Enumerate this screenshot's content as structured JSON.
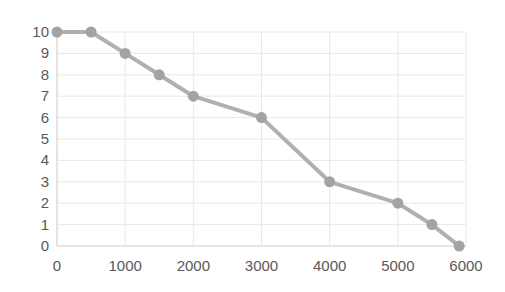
{
  "chart_data": {
    "type": "line",
    "title": "",
    "subtitle": "",
    "xlabel": "",
    "ylabel": "",
    "xlim": [
      0,
      6000
    ],
    "ylim": [
      0,
      10
    ],
    "xticks": [
      0,
      1000,
      2000,
      3000,
      4000,
      5000,
      6000
    ],
    "xtick_labels": [
      "0",
      "1000",
      "2000",
      "3000",
      "4000",
      "5000",
      "6000"
    ],
    "yticks": [
      0,
      1,
      2,
      3,
      4,
      5,
      6,
      7,
      8,
      9,
      10
    ],
    "ytick_labels": [
      "0",
      "1",
      "2",
      "3",
      "4",
      "5",
      "6",
      "7",
      "8",
      "9",
      "10"
    ],
    "grid": true,
    "grid_axis": "both",
    "legend": false,
    "legend_position": "none",
    "marker": "circle",
    "marker_size": 11,
    "line_width": 4,
    "series": [
      {
        "name": "series-1",
        "color": "#b0b0b0",
        "marker_color": "#a3a3a3",
        "x": [
          0,
          500,
          1000,
          1500,
          2000,
          3000,
          4000,
          5000,
          5500,
          5900
        ],
        "y": [
          10,
          10,
          9,
          8,
          7,
          6,
          3,
          2,
          1,
          0
        ],
        "points": [
          {
            "x": 0,
            "y": 10
          },
          {
            "x": 500,
            "y": 10
          },
          {
            "x": 1000,
            "y": 9
          },
          {
            "x": 1500,
            "y": 8
          },
          {
            "x": 2000,
            "y": 7
          },
          {
            "x": 3000,
            "y": 6
          },
          {
            "x": 4000,
            "y": 3
          },
          {
            "x": 5000,
            "y": 2
          },
          {
            "x": 5500,
            "y": 1
          },
          {
            "x": 5900,
            "y": 0
          }
        ]
      }
    ],
    "colors": {
      "background": "#ffffff",
      "grid": "#e8e8e8",
      "axis": "#d9d9d9",
      "tick_text": "#595959",
      "line": "#b0b0b0",
      "marker": "#a3a3a3"
    }
  }
}
